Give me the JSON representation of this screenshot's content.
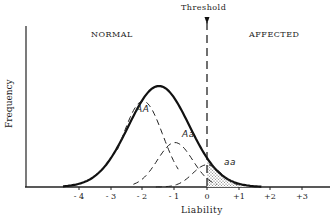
{
  "chart_data": {
    "type": "line",
    "title": "",
    "xlabel": "Liability",
    "ylabel": "Frequency",
    "x_ticks": [
      "- 4",
      "- 3",
      "- 2",
      "- 1",
      "0",
      "+1",
      "+2",
      "+3"
    ],
    "x_tick_values": [
      -4,
      -3,
      -2,
      -1,
      0,
      1,
      2,
      3
    ],
    "xlim": [
      -4.5,
      3.8
    ],
    "threshold": {
      "label": "Threshold",
      "x": 0
    },
    "regions": {
      "left": "NORMAL",
      "right": "AFFECTED"
    },
    "series": [
      {
        "name": "Total population",
        "style": "solid-bold",
        "mean": -1.5,
        "peak": 1.0
      },
      {
        "name": "AA",
        "style": "dashed",
        "mean": -2.0,
        "peak": 0.85
      },
      {
        "name": "Aa",
        "style": "dashed",
        "mean": -1.0,
        "peak": 0.44
      },
      {
        "name": "aa",
        "style": "dashed",
        "mean": 0.0,
        "peak": 0.22
      }
    ],
    "shaded_region": "Area under total curve to the right of threshold (affected)",
    "grid": false,
    "legend": "inline labels"
  },
  "labels": {
    "threshold": "Threshold",
    "normal": "NORMAL",
    "affected": "AFFECTED",
    "xlabel": "Liability",
    "ylabel": "Frequency",
    "genotype_AA": "AA",
    "genotype_Aa": "Aa",
    "genotype_aa": "aa"
  },
  "ticks": [
    {
      "label": "- 4",
      "x": 79
    },
    {
      "label": "- 3",
      "x": 111
    },
    {
      "label": "- 2",
      "x": 142
    },
    {
      "label": "- 1",
      "x": 174
    },
    {
      "label": "0",
      "x": 207
    },
    {
      "label": "+1",
      "x": 239
    },
    {
      "label": "+2",
      "x": 270
    },
    {
      "label": "+3",
      "x": 302
    }
  ]
}
